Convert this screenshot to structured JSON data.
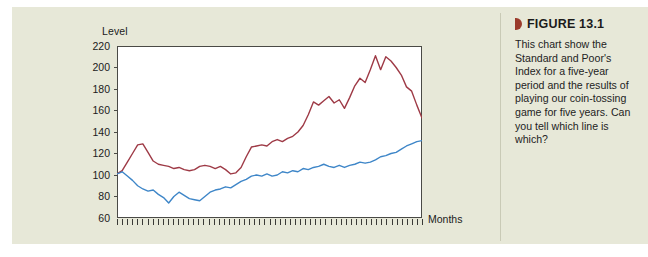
{
  "colors": {
    "panel_background": "#e7e8d8",
    "page_background": "#ffffff",
    "plot_background": "#ffffff",
    "axis": "#4a4a46",
    "sp_index_line": "#9e3a46",
    "coin_game_line": "#3e86c8",
    "figure_marker": "#9b3b2c",
    "caption_rule": "#c9cab6",
    "text": "#1b1b1b"
  },
  "caption": {
    "marker_icon": "triangle-marker-icon",
    "figure_label": "FIGURE 13.1",
    "body": "This chart show the Standard and Poor's Index for a five-year period and the results of playing our coin-tossing game for five years. Can you tell which line is which?"
  },
  "chart_data": {
    "type": "line",
    "title": "",
    "xlabel": "Months",
    "ylabel": "Level",
    "ylim": [
      60,
      220
    ],
    "yticks": [
      60,
      80,
      100,
      120,
      140,
      160,
      180,
      200,
      220
    ],
    "ytick_labels": [
      "60",
      "80",
      "100",
      "120",
      "140",
      "160",
      "180",
      "200",
      "220"
    ],
    "xlim": [
      0,
      60
    ],
    "xticks_count": 60,
    "xtick_labels": [],
    "grid": false,
    "legend": false,
    "legend_position": "none",
    "annotations": [],
    "x": [
      0,
      1,
      2,
      3,
      4,
      5,
      6,
      7,
      8,
      9,
      10,
      11,
      12,
      13,
      14,
      15,
      16,
      17,
      18,
      19,
      20,
      21,
      22,
      23,
      24,
      25,
      26,
      27,
      28,
      29,
      30,
      31,
      32,
      33,
      34,
      35,
      36,
      37,
      38,
      39,
      40,
      41,
      42,
      43,
      44,
      45,
      46,
      47,
      48,
      49,
      50,
      51,
      52,
      53,
      54,
      55,
      56,
      57,
      58,
      59
    ],
    "series": [
      {
        "name": "Standard and Poor's Index",
        "color": "#9e3a46",
        "values": [
          101,
          104,
          112,
          120,
          128,
          129,
          121,
          113,
          110,
          109,
          108,
          106,
          107,
          105,
          104,
          105,
          108,
          109,
          108,
          106,
          108,
          105,
          101,
          102,
          107,
          117,
          126,
          127,
          128,
          127,
          131,
          133,
          131,
          134,
          136,
          140,
          146,
          156,
          168,
          165,
          169,
          173,
          167,
          170,
          162,
          172,
          183,
          190,
          186,
          198,
          211,
          198,
          210,
          206,
          200,
          193,
          182,
          178,
          165,
          153
        ]
      },
      {
        "name": "Coin-tossing game",
        "color": "#3e86c8",
        "values": [
          101,
          103,
          99,
          95,
          90,
          87,
          85,
          86,
          82,
          79,
          74,
          80,
          84,
          81,
          78,
          77,
          76,
          80,
          84,
          86,
          87,
          89,
          88,
          91,
          94,
          96,
          99,
          100,
          99,
          101,
          99,
          100,
          103,
          102,
          104,
          103,
          106,
          105,
          107,
          108,
          110,
          108,
          107,
          109,
          107,
          109,
          110,
          112,
          111,
          112,
          114,
          117,
          118,
          120,
          121,
          124,
          127,
          129,
          131,
          132
        ]
      }
    ]
  }
}
